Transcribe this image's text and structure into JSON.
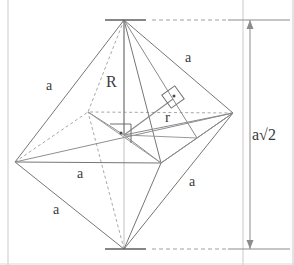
{
  "figure": {
    "type": "geometry-diagram",
    "shape": "octahedron",
    "colors": {
      "solid_edge": "#6b6b6b",
      "hidden_edge": "#9a9a9a",
      "axis": "#b8b8b8",
      "dimension": "#8c8c8c",
      "border": "#c9c9c9",
      "text": "#3a3a3a",
      "background": "#ffffff"
    },
    "vertices": {
      "top_apex": {
        "x": 124,
        "y": 20
      },
      "bottom_apex": {
        "x": 124,
        "y": 249
      },
      "left": {
        "x": 15,
        "y": 162
      },
      "right": {
        "x": 233,
        "y": 113
      },
      "front": {
        "x": 161,
        "y": 163
      },
      "back": {
        "x": 88,
        "y": 112
      },
      "center": {
        "x": 124,
        "y": 135
      }
    },
    "labels": [
      {
        "name": "edge-label-upper-left",
        "text": "a",
        "x": 46,
        "y": 79
      },
      {
        "name": "edge-label-upper-right",
        "text": "a",
        "x": 185,
        "y": 51
      },
      {
        "name": "edge-label-mid-left",
        "text": "a",
        "x": 77,
        "y": 167
      },
      {
        "name": "edge-label-lower-left",
        "text": "a",
        "x": 53,
        "y": 203
      },
      {
        "name": "edge-label-lower-right",
        "text": "a",
        "x": 189,
        "y": 175
      },
      {
        "name": "circumradius-label",
        "text": "R",
        "x": 106,
        "y": 74
      },
      {
        "name": "inradius-label",
        "text": "r",
        "x": 165,
        "y": 110
      }
    ],
    "dimension": {
      "name": "height-dimension",
      "base": "a",
      "radical": "√2",
      "text": "a√2",
      "label_x": 252,
      "label_y": 127,
      "line_x": 250,
      "top_y": 20,
      "bottom_y": 249
    },
    "markers": [
      {
        "name": "right-angle-marker-center",
        "kind": "right-angle-with-dot",
        "x": 124,
        "y": 135
      },
      {
        "name": "right-angle-marker-face",
        "kind": "right-angle-with-dot",
        "x": 173,
        "y": 97
      }
    ]
  }
}
